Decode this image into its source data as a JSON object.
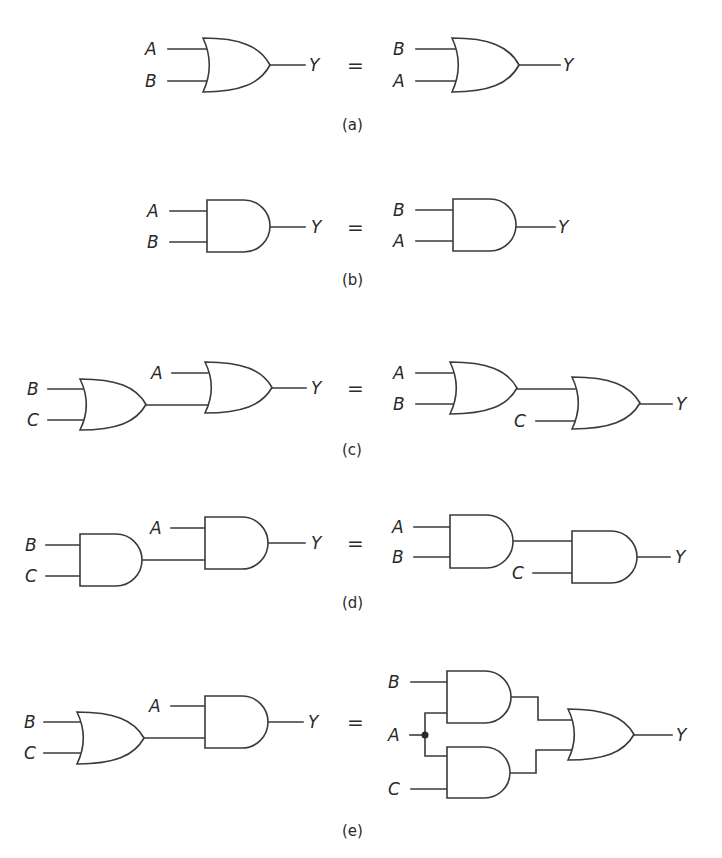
{
  "figure": {
    "equals_symbol": "=",
    "panels": [
      {
        "id": "a",
        "caption": "(a)",
        "law": "commutative-or",
        "left": {
          "gates": [
            {
              "type": "OR",
              "x": 203,
              "y": 38,
              "w": 67,
              "h": 54
            }
          ],
          "wires": [
            [
              [
                168,
                49
              ],
              [
                206,
                49
              ]
            ],
            [
              [
                168,
                81
              ],
              [
                206,
                81
              ]
            ],
            [
              [
                270,
                65
              ],
              [
                305,
                65
              ]
            ]
          ],
          "labels": [
            {
              "text": "A",
              "x": 145,
              "y": 55
            },
            {
              "text": "B",
              "x": 145,
              "y": 87
            },
            {
              "text": "Y",
              "x": 309,
              "y": 71
            }
          ]
        },
        "equals": {
          "x": 347,
          "y": 72
        },
        "right": {
          "gates": [
            {
              "type": "OR",
              "x": 452,
              "y": 38,
              "w": 67,
              "h": 54
            }
          ],
          "wires": [
            [
              [
                416,
                49
              ],
              [
                455,
                49
              ]
            ],
            [
              [
                416,
                81
              ],
              [
                455,
                81
              ]
            ],
            [
              [
                519,
                65
              ],
              [
                560,
                65
              ]
            ]
          ],
          "labels": [
            {
              "text": "B",
              "x": 393,
              "y": 55
            },
            {
              "text": "A",
              "x": 393,
              "y": 87
            },
            {
              "text": "Y",
              "x": 563,
              "y": 71
            }
          ]
        },
        "caption_pos": {
          "x": 342,
          "y": 130
        }
      },
      {
        "id": "b",
        "caption": "(b)",
        "law": "commutative-and",
        "left": {
          "gates": [
            {
              "type": "AND",
              "x": 207,
              "y": 200,
              "w": 63,
              "h": 52
            }
          ],
          "wires": [
            [
              [
                170,
                211
              ],
              [
                207,
                211
              ]
            ],
            [
              [
                170,
                242
              ],
              [
                207,
                242
              ]
            ],
            [
              [
                270,
                227
              ],
              [
                305,
                227
              ]
            ]
          ],
          "labels": [
            {
              "text": "A",
              "x": 147,
              "y": 217
            },
            {
              "text": "B",
              "x": 147,
              "y": 248
            },
            {
              "text": "Y",
              "x": 311,
              "y": 233
            }
          ]
        },
        "equals": {
          "x": 347,
          "y": 234
        },
        "right": {
          "gates": [
            {
              "type": "AND",
              "x": 453,
              "y": 199,
              "w": 63,
              "h": 52
            }
          ],
          "wires": [
            [
              [
                416,
                210
              ],
              [
                453,
                210
              ]
            ],
            [
              [
                416,
                241
              ],
              [
                453,
                241
              ]
            ],
            [
              [
                516,
                227
              ],
              [
                555,
                227
              ]
            ]
          ],
          "labels": [
            {
              "text": "B",
              "x": 393,
              "y": 216
            },
            {
              "text": "A",
              "x": 393,
              "y": 247
            },
            {
              "text": "Y",
              "x": 558,
              "y": 233
            }
          ]
        },
        "caption_pos": {
          "x": 342,
          "y": 285
        }
      },
      {
        "id": "c",
        "caption": "(c)",
        "law": "associative-or",
        "left": {
          "gates": [
            {
              "type": "OR",
              "x": 80,
              "y": 379,
              "w": 66,
              "h": 51
            },
            {
              "type": "OR",
              "x": 205,
              "y": 362,
              "w": 67,
              "h": 51
            }
          ],
          "wires": [
            [
              [
                48,
                389
              ],
              [
                83,
                389
              ]
            ],
            [
              [
                48,
                420
              ],
              [
                83,
                420
              ]
            ],
            [
              [
                146,
                405
              ],
              [
                208,
                405
              ]
            ],
            [
              [
                172,
                373
              ],
              [
                208,
                373
              ]
            ],
            [
              [
                272,
                388
              ],
              [
                306,
                388
              ]
            ]
          ],
          "labels": [
            {
              "text": "B",
              "x": 27,
              "y": 395
            },
            {
              "text": "C",
              "x": 27,
              "y": 426
            },
            {
              "text": "A",
              "x": 151,
              "y": 379
            },
            {
              "text": "Y",
              "x": 311,
              "y": 394
            }
          ]
        },
        "equals": {
          "x": 347,
          "y": 395
        },
        "right": {
          "gates": [
            {
              "type": "OR",
              "x": 450,
              "y": 362,
              "w": 67,
              "h": 52
            },
            {
              "type": "OR",
              "x": 572,
              "y": 377,
              "w": 68,
              "h": 52
            }
          ],
          "wires": [
            [
              [
                416,
                373
              ],
              [
                453,
                373
              ]
            ],
            [
              [
                416,
                404
              ],
              [
                453,
                404
              ]
            ],
            [
              [
                517,
                389
              ],
              [
                575,
                389
              ]
            ],
            [
              [
                536,
                421
              ],
              [
                575,
                421
              ]
            ],
            [
              [
                640,
                404
              ],
              [
                672,
                404
              ]
            ]
          ],
          "labels": [
            {
              "text": "A",
              "x": 393,
              "y": 379
            },
            {
              "text": "B",
              "x": 393,
              "y": 410
            },
            {
              "text": "C",
              "x": 514,
              "y": 427
            },
            {
              "text": "Y",
              "x": 676,
              "y": 410
            }
          ]
        },
        "caption_pos": {
          "x": 342,
          "y": 455
        }
      },
      {
        "id": "d",
        "caption": "(d)",
        "law": "associative-and",
        "left": {
          "gates": [
            {
              "type": "AND",
              "x": 80,
              "y": 534,
              "w": 62,
              "h": 52
            },
            {
              "type": "AND",
              "x": 205,
              "y": 517,
              "w": 63,
              "h": 52
            }
          ],
          "wires": [
            [
              [
                46,
                545
              ],
              [
                80,
                545
              ]
            ],
            [
              [
                46,
                576
              ],
              [
                80,
                576
              ]
            ],
            [
              [
                142,
                560
              ],
              [
                205,
                560
              ]
            ],
            [
              [
                171,
                528
              ],
              [
                205,
                528
              ]
            ],
            [
              [
                268,
                543
              ],
              [
                305,
                543
              ]
            ]
          ],
          "labels": [
            {
              "text": "B",
              "x": 25,
              "y": 551
            },
            {
              "text": "C",
              "x": 25,
              "y": 582
            },
            {
              "text": "A",
              "x": 150,
              "y": 534
            },
            {
              "text": "Y",
              "x": 311,
              "y": 549
            }
          ]
        },
        "equals": {
          "x": 347,
          "y": 550
        },
        "right": {
          "gates": [
            {
              "type": "AND",
              "x": 450,
              "y": 515,
              "w": 63,
              "h": 53
            },
            {
              "type": "AND",
              "x": 572,
              "y": 531,
              "w": 65,
              "h": 52
            }
          ],
          "wires": [
            [
              [
                414,
                527
              ],
              [
                450,
                527
              ]
            ],
            [
              [
                414,
                557
              ],
              [
                450,
                557
              ]
            ],
            [
              [
                513,
                541
              ],
              [
                572,
                541
              ]
            ],
            [
              [
                533,
                573
              ],
              [
                572,
                573
              ]
            ],
            [
              [
                637,
                557
              ],
              [
                670,
                557
              ]
            ]
          ],
          "labels": [
            {
              "text": "A",
              "x": 392,
              "y": 533
            },
            {
              "text": "B",
              "x": 392,
              "y": 563
            },
            {
              "text": "C",
              "x": 512,
              "y": 579
            },
            {
              "text": "Y",
              "x": 675,
              "y": 563
            }
          ]
        },
        "caption_pos": {
          "x": 342,
          "y": 608
        }
      },
      {
        "id": "e",
        "caption": "(e)",
        "law": "distributive",
        "left": {
          "gates": [
            {
              "type": "OR",
              "x": 77,
              "y": 712,
              "w": 67,
              "h": 52
            },
            {
              "type": "AND",
              "x": 205,
              "y": 696,
              "w": 63,
              "h": 52
            }
          ],
          "wires": [
            [
              [
                44,
                722
              ],
              [
                80,
                722
              ]
            ],
            [
              [
                44,
                753
              ],
              [
                80,
                753
              ]
            ],
            [
              [
                144,
                738
              ],
              [
                205,
                738
              ]
            ],
            [
              [
                171,
                706
              ],
              [
                205,
                706
              ]
            ],
            [
              [
                268,
                722
              ],
              [
                303,
                722
              ]
            ]
          ],
          "labels": [
            {
              "text": "B",
              "x": 24,
              "y": 728
            },
            {
              "text": "C",
              "x": 24,
              "y": 759
            },
            {
              "text": "A",
              "x": 149,
              "y": 712
            },
            {
              "text": "Y",
              "x": 308,
              "y": 728
            }
          ]
        },
        "equals": {
          "x": 347,
          "y": 729
        },
        "right": {
          "gates": [
            {
              "type": "AND",
              "x": 447,
              "y": 671,
              "w": 64,
              "h": 52
            },
            {
              "type": "AND",
              "x": 447,
              "y": 747,
              "w": 63,
              "h": 51
            },
            {
              "type": "OR",
              "x": 568,
              "y": 709,
              "w": 66,
              "h": 51
            }
          ],
          "wires": [
            [
              [
                411,
                682
              ],
              [
                447,
                682
              ]
            ],
            [
              [
                410,
                735
              ],
              [
                425,
                735
              ]
            ],
            [
              [
                447,
                713
              ],
              [
                425,
                713
              ],
              [
                425,
                756
              ],
              [
                447,
                756
              ]
            ],
            [
              [
                411,
                789
              ],
              [
                447,
                789
              ]
            ],
            [
              [
                511,
                697
              ],
              [
                538,
                697
              ],
              [
                538,
                720
              ],
              [
                572,
                720
              ]
            ],
            [
              [
                510,
                773
              ],
              [
                536,
                773
              ],
              [
                536,
                750
              ],
              [
                572,
                750
              ]
            ],
            [
              [
                634,
                735
              ],
              [
                672,
                735
              ]
            ]
          ],
          "junctions": [
            {
              "x": 425,
              "y": 735
            }
          ],
          "labels": [
            {
              "text": "B",
              "x": 388,
              "y": 688
            },
            {
              "text": "A",
              "x": 388,
              "y": 741
            },
            {
              "text": "C",
              "x": 388,
              "y": 795
            },
            {
              "text": "Y",
              "x": 676,
              "y": 741
            }
          ]
        },
        "caption_pos": {
          "x": 342,
          "y": 836
        }
      }
    ]
  }
}
